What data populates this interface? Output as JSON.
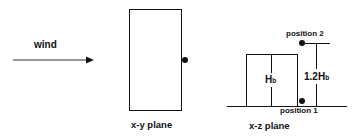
{
  "wind": {
    "label": "wind"
  },
  "xy_plane": {
    "label": "x-y plane"
  },
  "xz_plane": {
    "label": "x-z plane",
    "building_height_label": "H",
    "building_height_sub": "b",
    "height_label": "1.2H",
    "height_sub": "b",
    "position_1": "position 1",
    "position_2": "position 2"
  },
  "colors": {
    "stroke": "#111111",
    "background": "#ffffff"
  }
}
